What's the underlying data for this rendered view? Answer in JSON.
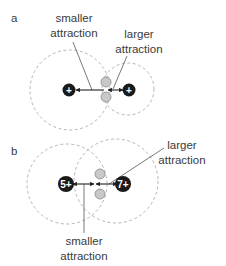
{
  "panels": [
    {
      "id": "a",
      "label": "a",
      "nucleus_left": {
        "charge": "+"
      },
      "nucleus_right": {
        "charge": "+"
      },
      "label_smaller": [
        "smaller",
        "attraction"
      ],
      "label_larger": [
        "larger",
        "attraction"
      ]
    },
    {
      "id": "b",
      "label": "b",
      "nucleus_left": {
        "charge": "5+"
      },
      "nucleus_right": {
        "charge": "7+"
      },
      "label_smaller": [
        "smaller",
        "attraction"
      ],
      "label_larger": [
        "larger",
        "attraction"
      ]
    }
  ],
  "colors": {
    "nucleus": "#1a1a1a",
    "electron_fill": "#c8c8c8",
    "electron_stroke": "#8a8a8a",
    "dashed_circle": "#b5b5b5",
    "text": "#3a3a3a",
    "line": "#333333"
  }
}
